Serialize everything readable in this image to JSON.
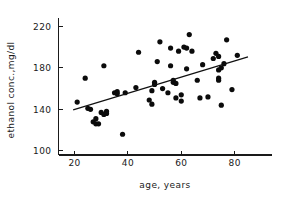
{
  "chart_data": {
    "type": "scatter",
    "title": "",
    "xlabel": "age, years",
    "ylabel": "ethanol conc.,mg/dl",
    "xlim": [
      14,
      94
    ],
    "ylim": [
      96,
      228
    ],
    "grid": false,
    "legend": "none",
    "x_ticks": [
      20,
      40,
      60,
      80
    ],
    "y_ticks": [
      100,
      140,
      180,
      220
    ],
    "x_tick_labels": [
      "20",
      "40",
      "60",
      "80"
    ],
    "y_tick_labels": [
      "100",
      "140",
      "180",
      "220"
    ],
    "marker": "filled-circle",
    "marker_color": "#0b0b0b",
    "points": [
      [
        21,
        147
      ],
      [
        24,
        170
      ],
      [
        25,
        141
      ],
      [
        26,
        140
      ],
      [
        27,
        128
      ],
      [
        28,
        126
      ],
      [
        28,
        131
      ],
      [
        29,
        126
      ],
      [
        30,
        137
      ],
      [
        31,
        182
      ],
      [
        31,
        135
      ],
      [
        32,
        138
      ],
      [
        32,
        136
      ],
      [
        35,
        156
      ],
      [
        36,
        157
      ],
      [
        36,
        155
      ],
      [
        38,
        116
      ],
      [
        39,
        156
      ],
      [
        43,
        161
      ],
      [
        44,
        195
      ],
      [
        48,
        149
      ],
      [
        49,
        145
      ],
      [
        49,
        158
      ],
      [
        50,
        166
      ],
      [
        50,
        164
      ],
      [
        51,
        186
      ],
      [
        52,
        205
      ],
      [
        53,
        160
      ],
      [
        55,
        156
      ],
      [
        56,
        182
      ],
      [
        56,
        199
      ],
      [
        57,
        168
      ],
      [
        57,
        166
      ],
      [
        58,
        165
      ],
      [
        58,
        151
      ],
      [
        59,
        196
      ],
      [
        60,
        148
      ],
      [
        60,
        154
      ],
      [
        61,
        200
      ],
      [
        62,
        199
      ],
      [
        62,
        179
      ],
      [
        63,
        212
      ],
      [
        64,
        196
      ],
      [
        66,
        168
      ],
      [
        67,
        151
      ],
      [
        68,
        183
      ],
      [
        70,
        152
      ],
      [
        72,
        189
      ],
      [
        73,
        194
      ],
      [
        74,
        191
      ],
      [
        74,
        178
      ],
      [
        74,
        170
      ],
      [
        74,
        168
      ],
      [
        75,
        180
      ],
      [
        75,
        144
      ],
      [
        76,
        184
      ],
      [
        77,
        207
      ],
      [
        79,
        159
      ],
      [
        81,
        192
      ]
    ],
    "fit_line": {
      "label": "regression line",
      "x0": 19.5,
      "y0": 139.5,
      "x1": 85,
      "y1": 190.5
    }
  }
}
